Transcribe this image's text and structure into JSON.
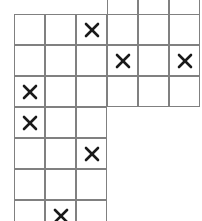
{
  "board": {
    "title": "Staircase grid with X marks",
    "origin_x": 14,
    "origin_y": 14,
    "cell_size": 31,
    "line_color": "#808080",
    "mark_color": "#1a1a1a",
    "background": "#ffffff",
    "mark_glyph": "X",
    "columns": 6,
    "rows": 7,
    "partial_top_row": {
      "label": "partial-row-above",
      "y": -8,
      "height": 9,
      "start_col": 4,
      "end_col": 6,
      "cells": [
        {
          "col": 4,
          "mark": ""
        },
        {
          "col": 5,
          "mark": ""
        },
        {
          "col": 6,
          "mark": ""
        }
      ]
    },
    "rows_data": [
      {
        "index": 1,
        "width_cols": 6,
        "cells": [
          {
            "col": 1,
            "mark": ""
          },
          {
            "col": 2,
            "mark": ""
          },
          {
            "col": 3,
            "mark": "X"
          },
          {
            "col": 4,
            "mark": ""
          },
          {
            "col": 5,
            "mark": ""
          },
          {
            "col": 6,
            "mark": ""
          }
        ]
      },
      {
        "index": 2,
        "width_cols": 6,
        "cells": [
          {
            "col": 1,
            "mark": ""
          },
          {
            "col": 2,
            "mark": ""
          },
          {
            "col": 3,
            "mark": ""
          },
          {
            "col": 4,
            "mark": "X"
          },
          {
            "col": 5,
            "mark": ""
          },
          {
            "col": 6,
            "mark": "X"
          }
        ]
      },
      {
        "index": 3,
        "width_cols": 6,
        "cells": [
          {
            "col": 1,
            "mark": "X"
          },
          {
            "col": 2,
            "mark": ""
          },
          {
            "col": 3,
            "mark": ""
          },
          {
            "col": 4,
            "mark": ""
          },
          {
            "col": 5,
            "mark": ""
          },
          {
            "col": 6,
            "mark": ""
          }
        ]
      },
      {
        "index": 4,
        "width_cols": 3,
        "cells": [
          {
            "col": 1,
            "mark": "X"
          },
          {
            "col": 2,
            "mark": ""
          },
          {
            "col": 3,
            "mark": ""
          }
        ]
      },
      {
        "index": 5,
        "width_cols": 3,
        "cells": [
          {
            "col": 1,
            "mark": ""
          },
          {
            "col": 2,
            "mark": ""
          },
          {
            "col": 3,
            "mark": "X"
          }
        ]
      },
      {
        "index": 6,
        "width_cols": 3,
        "cells": [
          {
            "col": 1,
            "mark": ""
          },
          {
            "col": 2,
            "mark": ""
          },
          {
            "col": 3,
            "mark": ""
          }
        ]
      },
      {
        "index": 7,
        "width_cols": 3,
        "cells": [
          {
            "col": 1,
            "mark": ""
          },
          {
            "col": 2,
            "mark": "X"
          },
          {
            "col": 3,
            "mark": ""
          }
        ]
      }
    ],
    "marked_cells": [
      {
        "row": 1,
        "col": 3
      },
      {
        "row": 2,
        "col": 4
      },
      {
        "row": 2,
        "col": 6
      },
      {
        "row": 3,
        "col": 1
      },
      {
        "row": 4,
        "col": 1
      },
      {
        "row": 5,
        "col": 3
      },
      {
        "row": 7,
        "col": 2
      }
    ],
    "mark_count": 7
  }
}
